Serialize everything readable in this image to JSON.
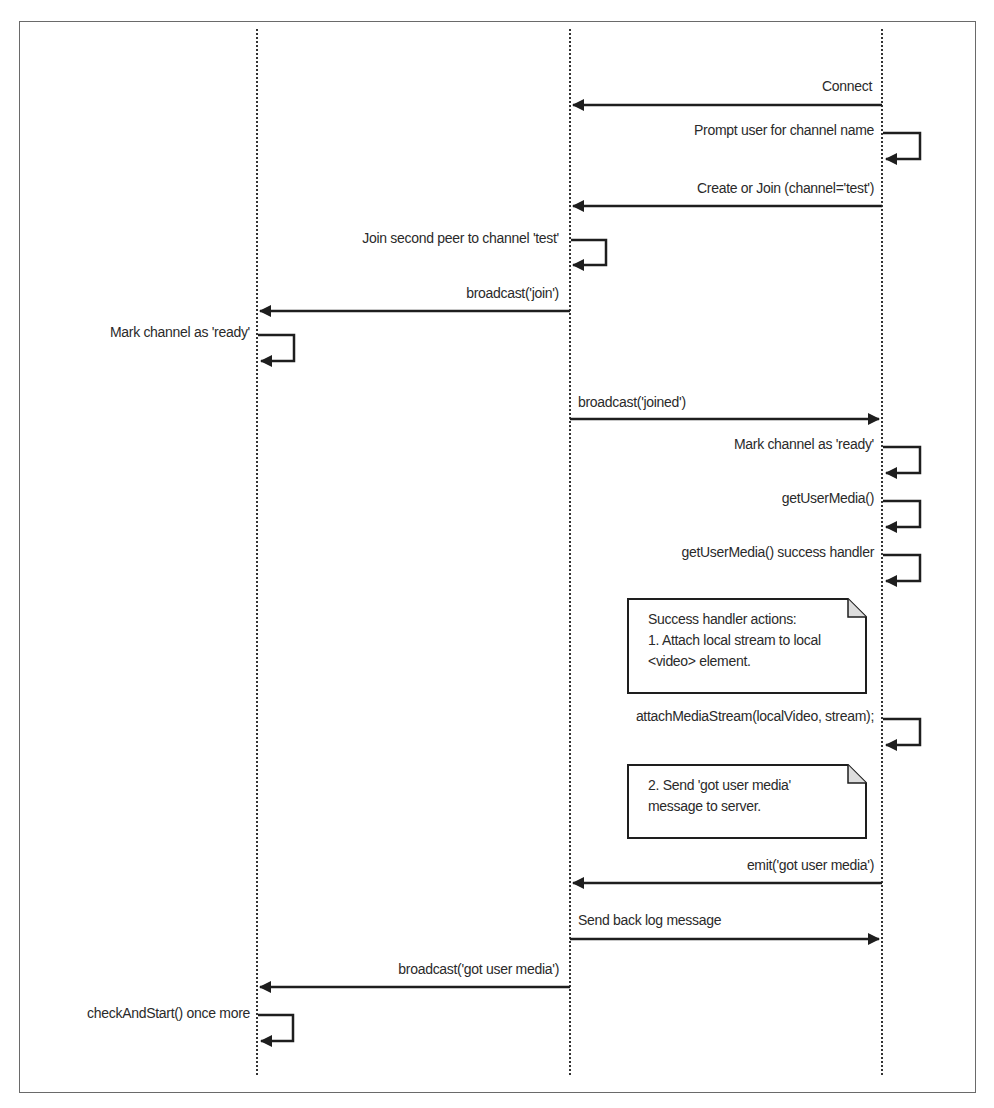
{
  "diagram": {
    "type": "sequence",
    "lifelines": [
      {
        "id": "peer1",
        "x": 257
      },
      {
        "id": "server",
        "x": 570
      },
      {
        "id": "peer2",
        "x": 882
      }
    ],
    "messages": [
      {
        "id": "m1",
        "label": "Connect",
        "from": "peer2",
        "to": "server",
        "y": 105
      },
      {
        "id": "m2",
        "label": "Prompt user for channel name",
        "from": "peer2",
        "to": "peer2",
        "self": true,
        "y": 133
      },
      {
        "id": "m3",
        "label": "Create or Join (channel='test')",
        "from": "peer2",
        "to": "server",
        "y": 206
      },
      {
        "id": "m4",
        "label": "Join second peer to channel 'test'",
        "from": "server",
        "to": "server",
        "self": true,
        "y": 240
      },
      {
        "id": "m5",
        "label": "broadcast('join')",
        "from": "server",
        "to": "peer1",
        "y": 311
      },
      {
        "id": "m6",
        "label": "Mark channel as 'ready'",
        "from": "peer1",
        "to": "peer1",
        "self": true,
        "y": 335
      },
      {
        "id": "m7",
        "label": "broadcast('joined')",
        "from": "server",
        "to": "peer2",
        "y": 419
      },
      {
        "id": "m8",
        "label": "Mark channel as 'ready'",
        "from": "peer2",
        "to": "peer2",
        "self": true,
        "y": 447
      },
      {
        "id": "m9",
        "label": "getUserMedia()",
        "from": "peer2",
        "to": "peer2",
        "self": true,
        "y": 501
      },
      {
        "id": "m10",
        "label": "getUserMedia() success handler",
        "from": "peer2",
        "to": "peer2",
        "self": true,
        "y": 555
      },
      {
        "id": "m11",
        "label": "attachMediaStream(localVideo, stream);",
        "from": "peer2",
        "to": "peer2",
        "self": true,
        "y": 719
      },
      {
        "id": "m12",
        "label": "emit('got user media')",
        "from": "peer2",
        "to": "server",
        "y": 883
      },
      {
        "id": "m13",
        "label": "Send back log message",
        "from": "server",
        "to": "peer2",
        "y": 939
      },
      {
        "id": "m14",
        "label": "broadcast('got user media')",
        "from": "server",
        "to": "peer1",
        "y": 987
      },
      {
        "id": "m15",
        "label": "checkAndStart() once more",
        "from": "peer1",
        "to": "peer1",
        "self": true,
        "y": 1015
      }
    ],
    "notes": [
      {
        "id": "n1",
        "lines": [
          "Success handler actions:",
          "1. Attach local stream to local",
          "<video> element."
        ]
      },
      {
        "id": "n2",
        "lines": [
          "2. Send 'got user media'",
          "message to server."
        ]
      }
    ]
  },
  "colors": {
    "line": "#1e1e1e",
    "frame": "#6a6a6a",
    "lifeline": "#333333",
    "background": "#ffffff"
  }
}
